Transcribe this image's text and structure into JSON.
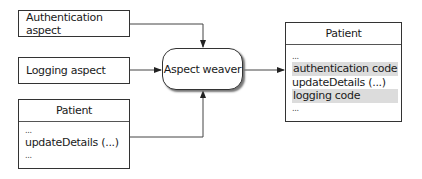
{
  "diagram": {
    "nodes": {
      "auth_aspect": {
        "label": "Authentication aspect"
      },
      "logging_aspect": {
        "label": "Logging aspect"
      },
      "patient_input": {
        "title": "Patient",
        "lines": [
          "...",
          "updateDetails (...)",
          "..."
        ]
      },
      "aspect_weaver": {
        "label": "Aspect weaver"
      },
      "patient_output": {
        "title": "Patient",
        "lines": [
          {
            "text": "...",
            "highlight": false
          },
          {
            "text": "authentication code",
            "highlight": true
          },
          {
            "text": "updateDetails (...)",
            "highlight": false
          },
          {
            "text": "logging code",
            "highlight": true
          },
          {
            "text": "...",
            "highlight": false
          }
        ]
      }
    },
    "edges": [
      {
        "from": "Authentication aspect",
        "to": "Aspect weaver"
      },
      {
        "from": "Logging aspect",
        "to": "Aspect weaver"
      },
      {
        "from": "Patient",
        "to": "Aspect weaver"
      },
      {
        "from": "Aspect weaver",
        "to": "Patient (woven)"
      }
    ],
    "colors": {
      "stroke": "#333333",
      "highlight": "#dcdcdc"
    }
  }
}
